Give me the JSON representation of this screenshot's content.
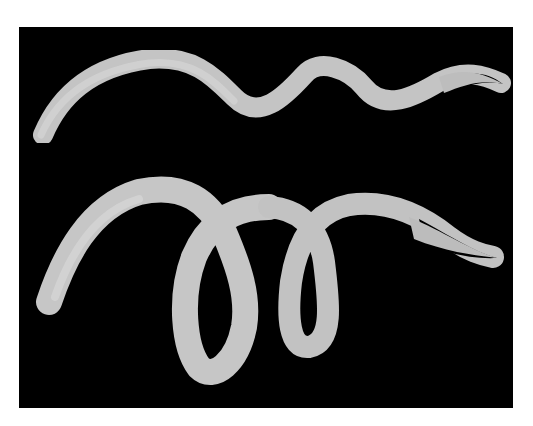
{
  "image": {
    "description": "Illustration of two nematode worms on a black background",
    "background_color": "#000000",
    "page_color": "#ffffff",
    "worm_color": "#c8c8c8",
    "subjects": [
      {
        "name": "upper-worm",
        "shape": "wavy, sinusoidal body tapering to a pointed tail on the right"
      },
      {
        "name": "lower-worm",
        "shape": "coiled body with two loops tapering to a pointed tail on the right"
      }
    ]
  }
}
